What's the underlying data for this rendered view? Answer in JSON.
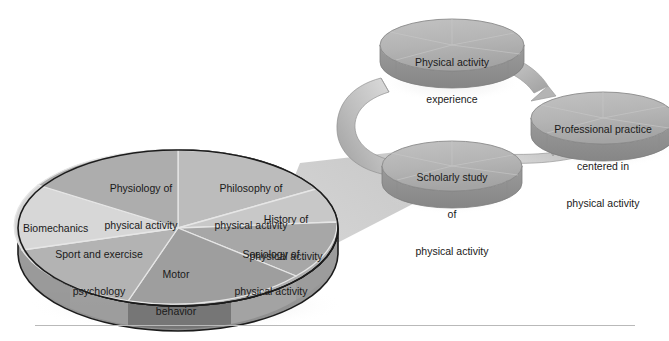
{
  "figure": {
    "background_color": "#ffffff"
  },
  "cycle": {
    "nodes": [
      {
        "id": "experience",
        "label_lines": [
          "Physical activity",
          "experience"
        ]
      },
      {
        "id": "professional",
        "label_lines": [
          "Professional practice",
          "centered in",
          "physical activity"
        ]
      },
      {
        "id": "scholarly",
        "label_lines": [
          "Scholarly study",
          "of",
          "physical activity"
        ]
      }
    ],
    "arrows": [
      {
        "from": "experience",
        "to": "professional",
        "shape": "arc-right"
      },
      {
        "from": "experience",
        "to": "scholarly",
        "shape": "arc-left"
      },
      {
        "from": "scholarly",
        "to": "professional",
        "shape": "arc-bottom"
      }
    ]
  },
  "pie": {
    "name": "subdisciplines-pie",
    "slices": [
      {
        "id": "physiology",
        "label_lines": [
          "Physiology of",
          "physical activity"
        ],
        "color": "#a9a9a9"
      },
      {
        "id": "philosophy",
        "label_lines": [
          "Philosophy of",
          "physical activity"
        ],
        "color": "#b7b7b7"
      },
      {
        "id": "history",
        "label_lines": [
          "History of",
          "physical activity"
        ],
        "color": "#c3c3c3"
      },
      {
        "id": "sociology",
        "label_lines": [
          "Sociology of",
          "physical activity"
        ],
        "color": "#a6a6a6"
      },
      {
        "id": "motor",
        "label_lines": [
          "Motor",
          "behavior"
        ],
        "color": "#9d9d9d"
      },
      {
        "id": "sport-psych",
        "label_lines": [
          "Sport and exercise",
          "psychology"
        ],
        "color": "#b0b0b0"
      },
      {
        "id": "biomechanics",
        "label_lines": [
          "Biomechanics"
        ],
        "color": "#d2d2d2"
      }
    ]
  },
  "colors": {
    "cylinder_top": "#b5b5b5",
    "cylinder_side": "#8f8f8f",
    "ribbon_light": "#d4d4d4",
    "ribbon_dark": "#a3a3a3",
    "callout_wedge": "#cfcfcf",
    "pie_outline": "#1c1c1c",
    "rule": "#b9b9b9",
    "text": "#1a1a1a"
  }
}
